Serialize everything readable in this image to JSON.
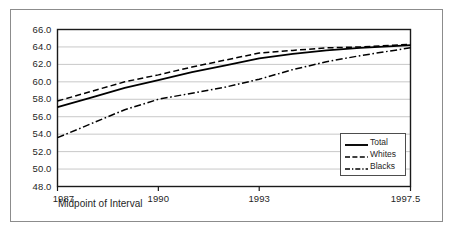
{
  "figure": {
    "background_color": "#ffffff",
    "frame_color": "#8c8c8c",
    "axis_color": "#1a1a1a",
    "grid_color": "#c8c8c8"
  },
  "chart_data": {
    "type": "line",
    "title": "",
    "xlabel": "Midpoint of Interval",
    "ylabel": "",
    "xlim": [
      1987,
      1997.5
    ],
    "ylim": [
      48.0,
      66.0
    ],
    "grid": "horizontal",
    "legend_position": "lower right",
    "xticks": [
      1987,
      1990,
      1993,
      1997.5
    ],
    "xtick_labels": [
      "1987",
      "1990",
      "1993",
      "1997.5"
    ],
    "yticks": [
      48.0,
      50.0,
      52.0,
      54.0,
      56.0,
      58.0,
      60.0,
      62.0,
      64.0,
      66.0
    ],
    "ytick_labels": [
      "48.0",
      "50.0",
      "52.0",
      "54.0",
      "56.0",
      "58.0",
      "60.0",
      "62.0",
      "64.0",
      "66.0"
    ],
    "x": [
      1987,
      1988,
      1989,
      1990,
      1991,
      1992,
      1993,
      1994,
      1995,
      1996,
      1997,
      1997.5
    ],
    "series": [
      {
        "name": "Total",
        "style": "solid",
        "color": "#000000",
        "values": [
          57.1,
          58.2,
          59.3,
          60.2,
          61.1,
          61.9,
          62.7,
          63.2,
          63.6,
          63.9,
          64.1,
          64.2
        ]
      },
      {
        "name": "Whites",
        "style": "dashed",
        "color": "#000000",
        "values": [
          57.8,
          58.9,
          60.0,
          60.8,
          61.7,
          62.5,
          63.3,
          63.6,
          63.9,
          64.0,
          64.2,
          64.3
        ]
      },
      {
        "name": "Blacks",
        "style": "dashdot",
        "color": "#000000",
        "values": [
          53.6,
          55.2,
          56.8,
          58.0,
          58.7,
          59.4,
          60.3,
          61.4,
          62.3,
          63.0,
          63.6,
          63.9
        ]
      }
    ]
  }
}
